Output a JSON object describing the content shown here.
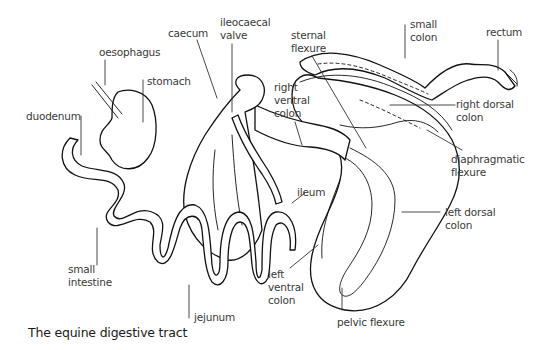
{
  "figure": {
    "caption": "The equine digestive tract",
    "labels": {
      "oesophagus": "oesophagus",
      "stomach": "stomach",
      "duodenum": "duodenum",
      "caecum": "caecum",
      "ileocaecal_valve": "ileocaecal\nvalve",
      "sternal_flexure": "sternal\nflexure",
      "small_colon": "small\ncolon",
      "rectum": "rectum",
      "right_ventral_colon": "right\nventral\ncolon",
      "right_dorsal_colon": "right dorsal\ncolon",
      "diaphragmatic_flexure": "diaphragmatic\nflexure",
      "ileum": "ileum",
      "left_dorsal_colon": "left dorsal\ncolon",
      "small_intestine": "small\nintestine",
      "left_ventral_colon": "left\nventral\ncolon",
      "jejunum": "jejunum",
      "pelvic_flexure": "pelvic flexure"
    }
  }
}
